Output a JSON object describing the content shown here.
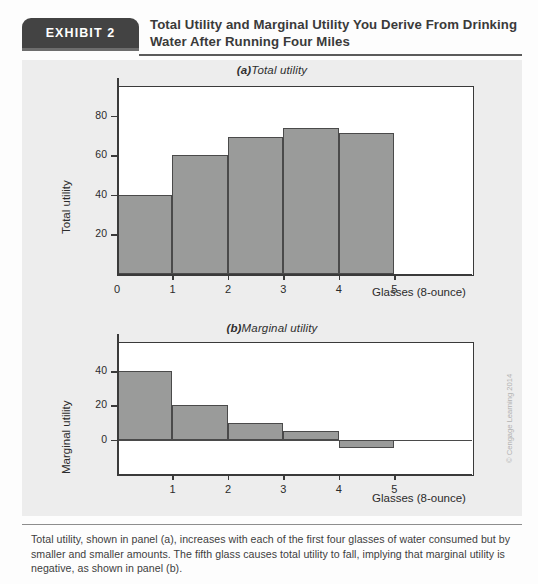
{
  "exhibit": {
    "badge_label": "EXHIBIT 2",
    "title": "Total Utility and Marginal Utility You Derive From Drinking Water After Running Four Miles"
  },
  "caption": "Total utility, shown in panel (a), increases with each of the first four glasses of water consumed but by smaller and smaller amounts. The fifth glass causes total utility to fall, implying that marginal utility is negative, as shown in panel (b).",
  "credit": "© Cengage Learning 2014",
  "colors": {
    "bar_fill": "#9a9b9a",
    "bar_stroke": "#4a4a4a",
    "axis": "#3a3a3a",
    "panel_bg": "#ededed",
    "badge_bg": "#434343",
    "plot_bg": "#ffffff"
  },
  "chart_data": [
    {
      "type": "bar",
      "panel": "a",
      "title_prefix": "(a)",
      "title": "Total utility",
      "categories": [
        "0-1",
        "1-2",
        "2-3",
        "3-4",
        "4-5"
      ],
      "x": [
        0,
        1,
        2,
        3,
        4,
        5
      ],
      "values": [
        40,
        60,
        69,
        74,
        71
      ],
      "xlabel": "Glasses (8-ounce)",
      "ylabel": "Total utility",
      "xticks": [
        "0",
        "1",
        "2",
        "3",
        "4",
        "5"
      ],
      "yticks": [
        "20",
        "40",
        "60",
        "80"
      ],
      "ytick_values": [
        20,
        40,
        60,
        80
      ],
      "ylim": [
        0,
        95
      ],
      "xlim": [
        0,
        6.4
      ],
      "grid": false,
      "legend": "none"
    },
    {
      "type": "bar",
      "panel": "b",
      "title_prefix": "(b)",
      "title": "Marginal utility",
      "categories": [
        "0-1",
        "1-2",
        "2-3",
        "3-4",
        "4-5"
      ],
      "x": [
        0,
        1,
        2,
        3,
        4,
        5
      ],
      "values": [
        40,
        20,
        10,
        5,
        -5
      ],
      "xlabel": "Glasses (8-ounce)",
      "ylabel": "Marginal utility",
      "xticks": [
        "1",
        "2",
        "3",
        "4",
        "5"
      ],
      "yticks": [
        "0",
        "20",
        "40"
      ],
      "ytick_values": [
        0,
        20,
        40
      ],
      "ylim": [
        -20,
        57
      ],
      "xlim": [
        0,
        6.4
      ],
      "grid": false,
      "legend": "none"
    }
  ]
}
